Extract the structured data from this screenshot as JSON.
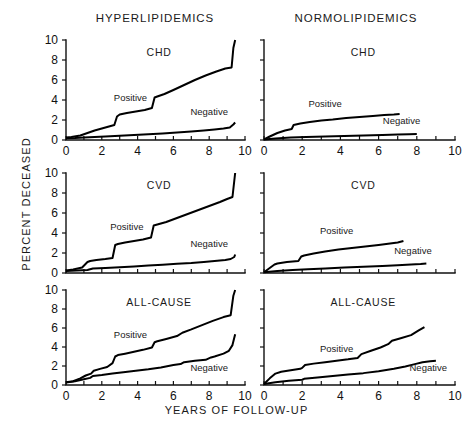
{
  "figure": {
    "column_titles": {
      "left": "HYPERLIPIDEMICS",
      "right": "NORMOLIPIDEMICS"
    },
    "ylabel": "PERCENT DECEASED",
    "xlabel": "YEARS OF FOLLOW-UP",
    "series_labels": {
      "positive": "Positive",
      "negative": "Negative"
    }
  },
  "chart_data": [
    {
      "type": "line",
      "title": "CHD",
      "panel": "hyperlipidemics-chd",
      "column": "HYPERLIPIDEMICS",
      "row": "CHD",
      "xlabel": "YEARS OF FOLLOW-UP",
      "ylabel": "PERCENT DECEASED",
      "xlim": [
        0,
        10
      ],
      "ylim": [
        0,
        10
      ],
      "xticks": [
        0,
        1,
        2,
        3,
        4,
        5,
        6,
        7,
        8,
        9,
        10
      ],
      "xticklabels": [
        "0",
        "",
        "2",
        "",
        "4",
        "",
        "6",
        "",
        "8",
        "",
        "10"
      ],
      "yticks": [
        0,
        2,
        4,
        6,
        8,
        10
      ],
      "yticklabels": [
        "0",
        "2",
        "4",
        "6",
        "8",
        "10"
      ],
      "grid": false,
      "legend": "inline-annotation",
      "series": [
        {
          "name": "Positive",
          "x": [
            0.0,
            0.3,
            0.8,
            1.2,
            1.6,
            2.0,
            2.4,
            2.7,
            2.85,
            3.0,
            3.4,
            3.9,
            4.4,
            4.8,
            4.95,
            5.1,
            5.5,
            6.0,
            6.6,
            7.2,
            7.8,
            8.4,
            8.9,
            9.25,
            9.35,
            9.45
          ],
          "y": [
            0.25,
            0.3,
            0.45,
            0.7,
            0.95,
            1.15,
            1.35,
            1.5,
            2.35,
            2.55,
            2.7,
            2.85,
            3.0,
            3.2,
            4.25,
            4.35,
            4.6,
            5.0,
            5.5,
            6.0,
            6.45,
            6.85,
            7.15,
            7.25,
            9.2,
            10.0
          ]
        },
        {
          "name": "Negative",
          "x": [
            0.0,
            0.5,
            1.0,
            1.6,
            2.2,
            3.0,
            3.8,
            4.6,
            5.4,
            6.2,
            7.0,
            7.7,
            8.3,
            8.8,
            9.15,
            9.35,
            9.45
          ],
          "y": [
            0.18,
            0.2,
            0.25,
            0.3,
            0.35,
            0.42,
            0.5,
            0.58,
            0.65,
            0.75,
            0.85,
            0.95,
            1.05,
            1.15,
            1.25,
            1.55,
            1.75
          ]
        }
      ]
    },
    {
      "type": "line",
      "title": "CHD",
      "panel": "normolipidemics-chd",
      "column": "NORMOLIPIDEMICS",
      "row": "CHD",
      "xlabel": "YEARS OF FOLLOW-UP",
      "ylabel": "PERCENT DECEASED",
      "xlim": [
        0,
        10
      ],
      "ylim": [
        0,
        10
      ],
      "xticks": [
        0,
        1,
        2,
        3,
        4,
        5,
        6,
        7,
        8,
        9,
        10
      ],
      "xticklabels": [
        "0",
        "",
        "2",
        "",
        "4",
        "",
        "6",
        "",
        "8",
        "",
        "10"
      ],
      "yticks": [
        0,
        2,
        4,
        6,
        8,
        10
      ],
      "yticklabels": [
        "",
        "",
        "",
        "",
        "",
        ""
      ],
      "grid": false,
      "legend": "inline-annotation",
      "series": [
        {
          "name": "Positive",
          "x": [
            0.0,
            0.3,
            0.7,
            1.1,
            1.45,
            1.55,
            1.9,
            2.4,
            3.0,
            3.6,
            4.3,
            5.0,
            5.7,
            6.3,
            6.8,
            7.1
          ],
          "y": [
            0.05,
            0.35,
            0.7,
            0.95,
            1.1,
            1.5,
            1.65,
            1.8,
            1.95,
            2.05,
            2.2,
            2.3,
            2.4,
            2.5,
            2.55,
            2.6
          ]
        },
        {
          "name": "Negative",
          "x": [
            0.0,
            0.6,
            1.4,
            2.2,
            3.2,
            4.2,
            5.2,
            6.2,
            7.0,
            7.6,
            8.0
          ],
          "y": [
            0.05,
            0.16,
            0.24,
            0.3,
            0.36,
            0.4,
            0.45,
            0.5,
            0.55,
            0.58,
            0.6
          ]
        }
      ]
    },
    {
      "type": "line",
      "title": "CVD",
      "panel": "hyperlipidemics-cvd",
      "column": "HYPERLIPIDEMICS",
      "row": "CVD",
      "xlabel": "YEARS OF FOLLOW-UP",
      "ylabel": "PERCENT DECEASED",
      "xlim": [
        0,
        10
      ],
      "ylim": [
        0,
        10
      ],
      "xticks": [
        0,
        1,
        2,
        3,
        4,
        5,
        6,
        7,
        8,
        9,
        10
      ],
      "xticklabels": [
        "",
        "",
        "",
        "",
        "",
        "",
        "",
        "",
        "",
        "",
        ""
      ],
      "yticks": [
        0,
        2,
        4,
        6,
        8,
        10
      ],
      "yticklabels": [
        "0",
        "2",
        "4",
        "6",
        "8",
        "10"
      ],
      "grid": false,
      "legend": "inline-annotation",
      "series": [
        {
          "name": "Positive",
          "x": [
            0.0,
            0.4,
            0.9,
            1.2,
            1.35,
            1.7,
            2.2,
            2.6,
            2.75,
            2.9,
            3.3,
            3.8,
            4.3,
            4.75,
            4.9,
            5.1,
            5.6,
            6.2,
            6.8,
            7.4,
            8.0,
            8.6,
            9.0,
            9.3,
            9.4,
            9.45
          ],
          "y": [
            0.25,
            0.35,
            0.55,
            1.1,
            1.2,
            1.3,
            1.4,
            1.5,
            2.8,
            2.9,
            3.05,
            3.2,
            3.35,
            3.55,
            4.75,
            4.85,
            5.1,
            5.5,
            5.9,
            6.3,
            6.7,
            7.1,
            7.4,
            7.6,
            9.2,
            10.0
          ]
        },
        {
          "name": "Negative",
          "x": [
            0.0,
            0.6,
            1.2,
            1.5,
            2.2,
            3.0,
            3.8,
            4.6,
            5.4,
            6.2,
            7.0,
            7.7,
            8.3,
            8.9,
            9.2,
            9.4,
            9.45
          ],
          "y": [
            0.2,
            0.25,
            0.3,
            0.45,
            0.5,
            0.58,
            0.66,
            0.74,
            0.82,
            0.92,
            1.0,
            1.1,
            1.2,
            1.3,
            1.4,
            1.6,
            1.85
          ]
        }
      ]
    },
    {
      "type": "line",
      "title": "CVD",
      "panel": "normolipidemics-cvd",
      "column": "NORMOLIPIDEMICS",
      "row": "CVD",
      "xlabel": "YEARS OF FOLLOW-UP",
      "ylabel": "PERCENT DECEASED",
      "xlim": [
        0,
        10
      ],
      "ylim": [
        0,
        10
      ],
      "xticks": [
        0,
        1,
        2,
        3,
        4,
        5,
        6,
        7,
        8,
        9,
        10
      ],
      "xticklabels": [
        "",
        "",
        "",
        "",
        "",
        "",
        "",
        "",
        "",
        "",
        ""
      ],
      "yticks": [
        0,
        2,
        4,
        6,
        8,
        10
      ],
      "yticklabels": [
        "",
        "",
        "",
        "",
        "",
        ""
      ],
      "grid": false,
      "legend": "inline-annotation",
      "series": [
        {
          "name": "Positive",
          "x": [
            0.0,
            0.3,
            0.55,
            0.7,
            1.2,
            1.8,
            1.95,
            2.1,
            2.6,
            3.2,
            3.9,
            4.6,
            5.3,
            6.0,
            6.6,
            7.0,
            7.3
          ],
          "y": [
            0.08,
            0.5,
            0.85,
            0.95,
            1.1,
            1.2,
            1.65,
            1.75,
            1.95,
            2.15,
            2.35,
            2.5,
            2.65,
            2.8,
            2.95,
            3.05,
            3.2
          ]
        },
        {
          "name": "Negative",
          "x": [
            0.0,
            0.7,
            1.5,
            2.3,
            3.2,
            4.2,
            5.2,
            6.2,
            7.0,
            7.7,
            8.2,
            8.5
          ],
          "y": [
            0.08,
            0.2,
            0.3,
            0.38,
            0.46,
            0.54,
            0.62,
            0.7,
            0.78,
            0.85,
            0.9,
            0.95
          ]
        }
      ]
    },
    {
      "type": "line",
      "title": "ALL-CAUSE",
      "panel": "hyperlipidemics-all-cause",
      "column": "HYPERLIPIDEMICS",
      "row": "ALL-CAUSE",
      "xlabel": "YEARS OF FOLLOW-UP",
      "ylabel": "PERCENT DECEASED",
      "xlim": [
        0,
        10
      ],
      "ylim": [
        0,
        10
      ],
      "xticks": [
        0,
        1,
        2,
        3,
        4,
        5,
        6,
        7,
        8,
        9,
        10
      ],
      "xticklabels": [
        "0",
        "",
        "2",
        "",
        "4",
        "",
        "6",
        "",
        "8",
        "",
        "10"
      ],
      "yticks": [
        0,
        2,
        4,
        6,
        8,
        10
      ],
      "yticklabels": [
        "0",
        "2",
        "4",
        "6",
        "8",
        "10"
      ],
      "grid": false,
      "legend": "inline-annotation",
      "series": [
        {
          "name": "Positive",
          "x": [
            0.0,
            0.4,
            0.8,
            1.1,
            1.4,
            1.55,
            1.9,
            2.3,
            2.6,
            2.75,
            2.9,
            3.3,
            3.8,
            4.3,
            4.8,
            4.95,
            5.1,
            5.6,
            6.2,
            6.5,
            7.0,
            7.6,
            8.2,
            8.8,
            9.2,
            9.35,
            9.45
          ],
          "y": [
            0.3,
            0.4,
            0.7,
            1.0,
            1.2,
            1.5,
            1.7,
            1.9,
            2.3,
            3.0,
            3.15,
            3.3,
            3.5,
            3.7,
            3.95,
            4.5,
            4.6,
            4.85,
            5.15,
            5.5,
            5.85,
            6.3,
            6.75,
            7.15,
            7.35,
            9.4,
            10.0
          ]
        },
        {
          "name": "Negative",
          "x": [
            0.0,
            0.5,
            1.0,
            1.35,
            1.5,
            2.0,
            2.6,
            3.2,
            3.9,
            4.6,
            5.3,
            6.0,
            6.4,
            6.6,
            7.2,
            7.8,
            8.1,
            8.3,
            8.8,
            9.1,
            9.3,
            9.45
          ],
          "y": [
            0.25,
            0.4,
            0.6,
            0.75,
            0.95,
            1.05,
            1.2,
            1.35,
            1.5,
            1.65,
            1.85,
            2.1,
            2.2,
            2.4,
            2.55,
            2.65,
            2.9,
            3.0,
            3.3,
            3.6,
            4.2,
            5.35
          ]
        }
      ]
    },
    {
      "type": "line",
      "title": "ALL-CAUSE",
      "panel": "normolipidemics-all-cause",
      "column": "NORMOLIPIDEMICS",
      "row": "ALL-CAUSE",
      "xlabel": "YEARS OF FOLLOW-UP",
      "ylabel": "PERCENT DECEASED",
      "xlim": [
        0,
        10
      ],
      "ylim": [
        0,
        10
      ],
      "xticks": [
        0,
        1,
        2,
        3,
        4,
        5,
        6,
        7,
        8,
        9,
        10
      ],
      "xticklabels": [
        "0",
        "",
        "2",
        "",
        "4",
        "",
        "6",
        "",
        "8",
        "",
        "10"
      ],
      "yticks": [
        0,
        2,
        4,
        6,
        8,
        10
      ],
      "yticklabels": [
        "",
        "",
        "",
        "",
        "",
        ""
      ],
      "grid": false,
      "legend": "inline-annotation",
      "series": [
        {
          "name": "Positive",
          "x": [
            0.0,
            0.3,
            0.6,
            0.9,
            1.4,
            1.9,
            2.0,
            2.15,
            2.6,
            3.2,
            3.8,
            4.4,
            4.9,
            5.1,
            5.6,
            6.1,
            6.5,
            6.7,
            7.2,
            7.7,
            8.1,
            8.4
          ],
          "y": [
            0.1,
            0.7,
            1.2,
            1.4,
            1.55,
            1.7,
            1.8,
            2.1,
            2.25,
            2.4,
            2.55,
            2.7,
            2.85,
            3.25,
            3.6,
            3.95,
            4.3,
            4.65,
            4.95,
            5.25,
            5.75,
            6.1
          ]
        },
        {
          "name": "Negative",
          "x": [
            0.0,
            0.6,
            1.3,
            2.0,
            2.1,
            2.8,
            3.6,
            4.4,
            5.2,
            6.0,
            6.8,
            7.4,
            7.9,
            8.3,
            8.7,
            9.0
          ],
          "y": [
            0.1,
            0.3,
            0.45,
            0.55,
            0.65,
            0.8,
            0.95,
            1.1,
            1.25,
            1.45,
            1.7,
            1.95,
            2.2,
            2.4,
            2.5,
            2.55
          ]
        }
      ]
    }
  ]
}
